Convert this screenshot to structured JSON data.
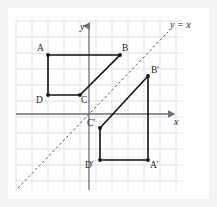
{
  "figure": {
    "kind": "coordinate-geometry-diagram",
    "topic": "reflection-over-line-y-equals-x",
    "background_color": "#f4f4f4",
    "plot_background_color": "#ffffff"
  },
  "grid": {
    "color": "#d9d9dd",
    "spacing_px": 16,
    "left_px": 16,
    "top_px": 21,
    "right_px": 182,
    "bottom_px": 190,
    "visible": true
  },
  "axes": {
    "color": "#6e6e78",
    "x_axis": {
      "label": "x",
      "label_name": "x-axis-label",
      "y_px": 114,
      "arrow": "right"
    },
    "y_axis": {
      "label": "y",
      "label_name": "y-axis-label",
      "x_px": 89,
      "arrow": "up"
    }
  },
  "mirror_line": {
    "label": "y = x",
    "style": "dashed",
    "color": "#4a4a55",
    "x1": 18,
    "y1": 188,
    "x2": 168,
    "y2": 32
  },
  "shapes": [
    {
      "name": "quadrilateral-abcd",
      "stroke": "#111111",
      "stroke_width": 1.6,
      "closed": true,
      "points": "48,55 120,55 80,95 48,95",
      "vertices": [
        {
          "label": "A",
          "x": 48,
          "y": 55,
          "label_x": 37,
          "label_y": 51
        },
        {
          "label": "B",
          "x": 120,
          "y": 55,
          "label_x": 122,
          "label_y": 51
        },
        {
          "label": "C",
          "x": 80,
          "y": 95,
          "label_x": 81,
          "label_y": 103
        },
        {
          "label": "D",
          "x": 48,
          "y": 95,
          "label_x": 36,
          "label_y": 103
        }
      ]
    },
    {
      "name": "quadrilateral-a-prime-b-prime-c-prime-d-prime",
      "stroke": "#111111",
      "stroke_width": 1.6,
      "closed": true,
      "points": "148,160 148,76 100,128 100,160",
      "vertices": [
        {
          "label": "B'",
          "x": 148,
          "y": 76,
          "label_x": 151,
          "label_y": 73
        },
        {
          "label": "A'",
          "x": 148,
          "y": 160,
          "label_x": 150,
          "label_y": 168
        },
        {
          "label": "C'",
          "x": 100,
          "y": 128,
          "label_x": 87,
          "label_y": 126
        },
        {
          "label": "D'",
          "x": 100,
          "y": 160,
          "label_x": 85,
          "label_y": 168
        }
      ]
    }
  ],
  "labels": {
    "line_equation_x": 170,
    "line_equation_y": 28
  }
}
